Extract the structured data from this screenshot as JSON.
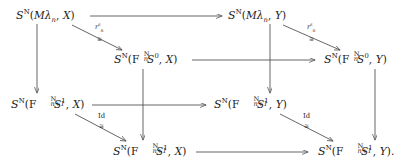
{
  "diagram": {
    "type": "commutative-cube",
    "line_color": "#555555",
    "text_color": "#1a1a1a",
    "background": "#ffffff",
    "nodes": [
      {
        "id": "top-left",
        "script": "S",
        "script_sup": "N",
        "open": "(",
        "arg1_prefix": "M",
        "arg1_lambda": "λ",
        "arg1_sub": "n",
        "comma": ",",
        "arg2": "X",
        "close": ")",
        "trailing": "",
        "plain": "S^N(Mλ_n, X)"
      },
      {
        "id": "top-right",
        "script": "S",
        "script_sup": "N",
        "open": "(",
        "arg1_prefix": "M",
        "arg1_lambda": "λ",
        "arg1_sub": "n",
        "comma": ",",
        "arg2": "Y",
        "close": ")",
        "trailing": "",
        "plain": "S^N(Mλ_n, Y)"
      },
      {
        "id": "mid-left",
        "script": "S",
        "script_sup": "N",
        "open": "(",
        "f_letter": "F",
        "f_sup": "N",
        "f_sub": "n",
        "sphere": "S",
        "sphere_sup": "0",
        "comma": ",",
        "arg2": "X",
        "close": ")",
        "trailing": "",
        "plain": "S^N(F_n^N S^0, X)"
      },
      {
        "id": "mid-right",
        "script": "S",
        "script_sup": "N",
        "open": "(",
        "f_letter": "F",
        "f_sup": "N",
        "f_sub": "n",
        "sphere": "S",
        "sphere_sup": "0",
        "comma": ",",
        "arg2": "Y",
        "close": ")",
        "trailing": "",
        "plain": "S^N(F_n^N S^0, Y)"
      },
      {
        "id": "lower-left",
        "script": "S",
        "script_sup": "N",
        "open": "(",
        "f_letter": "F",
        "f_sup": "N",
        "f_sub": "n+1",
        "sphere": "S",
        "sphere_sup": "1",
        "comma": ",",
        "arg2": "X",
        "close": ")",
        "trailing": "",
        "plain": "S^N(F_{n+1}^N S^1, X)"
      },
      {
        "id": "lower-right",
        "script": "S",
        "script_sup": "N",
        "open": "(",
        "f_letter": "F",
        "f_sup": "N",
        "f_sub": "n+1",
        "sphere": "S",
        "sphere_sup": "1",
        "comma": ",",
        "arg2": "Y",
        "close": ")",
        "trailing": "",
        "plain": "S^N(F_{n+1}^N S^1, Y)"
      },
      {
        "id": "bottom-left",
        "script": "S",
        "script_sup": "N",
        "open": "(",
        "f_letter": "F",
        "f_sup": "N",
        "f_sub": "n+1",
        "sphere": "S",
        "sphere_sup": "1",
        "comma": ",",
        "arg2": "X",
        "close": ")",
        "trailing": "",
        "plain": "S^N(F_{n+1}^N S^1, X)"
      },
      {
        "id": "bottom-right",
        "script": "S",
        "script_sup": "N",
        "open": "(",
        "f_letter": "F",
        "f_sup": "N",
        "f_sub": "n+1",
        "sphere": "S",
        "sphere_sup": "1",
        "comma": ",",
        "arg2": "Y",
        "close": ")",
        "trailing": ".",
        "plain": "S^N(F_{n+1}^N S^1, Y)."
      }
    ],
    "edge_labels": [
      {
        "id": "diag-top-left",
        "main": "r",
        "main_sub": "n",
        "main_sup": "ε",
        "iso": "≅"
      },
      {
        "id": "diag-top-right",
        "main": "r",
        "main_sub": "n",
        "main_sup": "ε",
        "iso": "≅"
      },
      {
        "id": "diag-bottom-left",
        "main": "Id",
        "main_sub": "",
        "main_sup": "",
        "iso": "≅"
      },
      {
        "id": "diag-bottom-right",
        "main": "Id",
        "main_sub": "",
        "main_sup": "",
        "iso": "≅"
      }
    ]
  }
}
